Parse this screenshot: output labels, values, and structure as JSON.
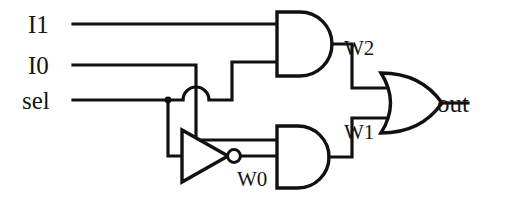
{
  "diagram": {
    "line_color": "#111111",
    "background_color": "#ffffff",
    "inputs": [
      {
        "id": "i1",
        "label": "I1"
      },
      {
        "id": "i0",
        "label": "I0"
      },
      {
        "id": "sel",
        "label": "sel"
      }
    ],
    "outputs": [
      {
        "id": "out",
        "label": "out"
      }
    ],
    "wire_labels": [
      {
        "id": "w2",
        "label": "W2"
      },
      {
        "id": "w1",
        "label": "W1"
      },
      {
        "id": "w0",
        "label": "W0"
      }
    ],
    "gates": [
      {
        "id": "and-top",
        "type": "AND",
        "output_label": "W2"
      },
      {
        "id": "and-bottom",
        "type": "AND",
        "output_label": "W1"
      },
      {
        "id": "not",
        "type": "NOT",
        "output_label": "W0"
      },
      {
        "id": "or",
        "type": "OR",
        "output_label": "out"
      }
    ]
  }
}
